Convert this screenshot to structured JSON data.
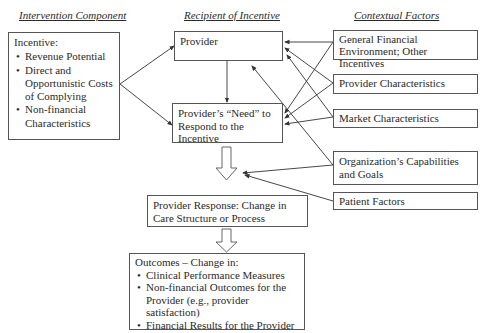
{
  "headers": {
    "intervention": "Intervention Component",
    "recipient": "Recipient of Incentive",
    "contextual": "Contextual Factors"
  },
  "incentive_box": {
    "title": "Incentive:",
    "items": [
      "Revenue Potential",
      "Direct and Opportunistic Costs of Complying",
      "Non-financial Characteristics"
    ]
  },
  "provider_box": {
    "label": "Provider"
  },
  "need_box": {
    "label": "Provider’s “Need” to Respond to the Incentive"
  },
  "response_box": {
    "label": "Provider Response: Change in Care Structure or Process"
  },
  "outcomes_box": {
    "title": "Outcomes – Change in:",
    "items": [
      "Clinical Performance Measures",
      "Non-financial Outcomes for the Provider (e.g., provider satisfaction)",
      "Financial Results for the Provider"
    ]
  },
  "contextual_factors": [
    "General Financial Environment; Other Incentives",
    "Provider Characteristics",
    "Market Characteristics",
    "Organization’s Capabilities and Goals",
    "Patient Factors"
  ]
}
